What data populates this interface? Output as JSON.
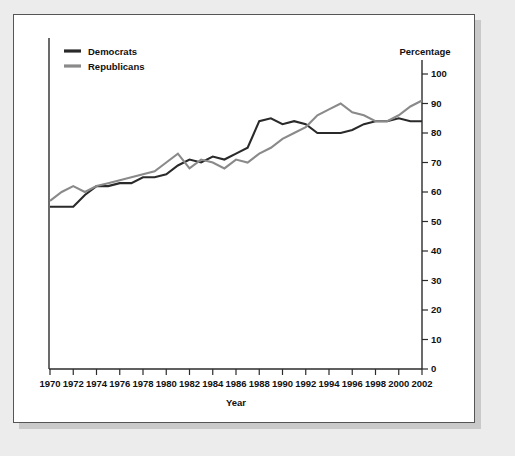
{
  "chart_data": {
    "type": "line",
    "title": "",
    "xlabel": "Year",
    "ylabel": "Percentage",
    "ylabel_position": "right",
    "grid": false,
    "legend_position": "top-left",
    "xlim": [
      1970,
      2002
    ],
    "ylim": [
      0,
      100
    ],
    "x_tick_labels": [
      "1970",
      "1972",
      "1974",
      "1976",
      "1978",
      "1980",
      "1982",
      "1984",
      "1986",
      "1988",
      "1990",
      "1992",
      "1994",
      "1996",
      "1998",
      "2000",
      "2002"
    ],
    "x_ticks": [
      1970,
      1972,
      1974,
      1976,
      1978,
      1980,
      1982,
      1984,
      1986,
      1988,
      1990,
      1992,
      1994,
      1996,
      1998,
      2000,
      2002
    ],
    "y_tick_labels": [
      "0",
      "10",
      "20",
      "30",
      "40",
      "50",
      "60",
      "70",
      "80",
      "90",
      "100"
    ],
    "y_ticks": [
      0,
      10,
      20,
      30,
      40,
      50,
      60,
      70,
      80,
      90,
      100
    ],
    "x": [
      1970,
      1971,
      1972,
      1973,
      1974,
      1975,
      1976,
      1977,
      1978,
      1979,
      1980,
      1981,
      1982,
      1983,
      1984,
      1985,
      1986,
      1987,
      1988,
      1989,
      1990,
      1991,
      1992,
      1993,
      1994,
      1995,
      1996,
      1997,
      1998,
      1999,
      2000,
      2001,
      2002
    ],
    "series": [
      {
        "name": "Democrats",
        "color": "#2a2a2a",
        "values": [
          55,
          55,
          55,
          59,
          62,
          62,
          63,
          63,
          65,
          65,
          66,
          69,
          71,
          70,
          72,
          71,
          73,
          75,
          84,
          85,
          83,
          84,
          83,
          80,
          80,
          80,
          81,
          83,
          84,
          84,
          85,
          84,
          84
        ]
      },
      {
        "name": "Republicans",
        "color": "#8a8a8a",
        "values": [
          57,
          60,
          62,
          60,
          62,
          63,
          64,
          65,
          66,
          67,
          70,
          73,
          68,
          71,
          70,
          68,
          71,
          70,
          73,
          75,
          78,
          80,
          82,
          86,
          88,
          90,
          87,
          86,
          84,
          84,
          86,
          89,
          91
        ]
      }
    ]
  },
  "legend": {
    "items": [
      {
        "label": "Democrats",
        "color": "#2a2a2a"
      },
      {
        "label": "Republicans",
        "color": "#8a8a8a"
      }
    ]
  }
}
